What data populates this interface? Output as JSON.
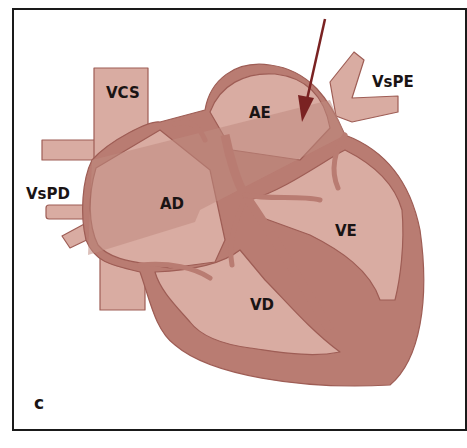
{
  "figure": {
    "panel_letter": "c",
    "labels": {
      "vcs": "VCS",
      "vspe": "VsPE",
      "vspd": "VsPD",
      "ae": "AE",
      "ad": "AD",
      "ve": "VE",
      "vd": "VD"
    },
    "colors": {
      "tissue_light": "#d9aca2",
      "tissue_wall": "#b97c72",
      "tissue_outline": "#9e5d55",
      "flow_band": "#c08a80",
      "arrow": "#7a2222",
      "frame": "#1a1a1a"
    }
  }
}
